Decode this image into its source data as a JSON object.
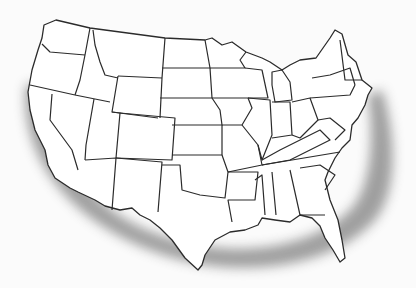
{
  "map": {
    "subject": "Contiguous United States outline map with state borders",
    "highlight": {
      "description": "Grey shaded arc along West Coast, southern border, Gulf Coast and Atlantic coast",
      "color": "#9a9a9a"
    },
    "colors": {
      "background": "#fbfbfb",
      "land": "#ffffff",
      "border": "#2b2b2b"
    }
  }
}
